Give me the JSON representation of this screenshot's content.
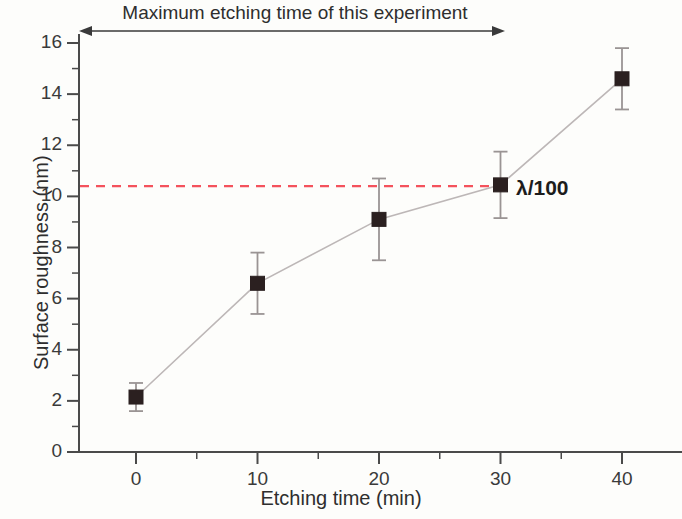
{
  "chart_data": {
    "type": "scatter",
    "title": "",
    "xlabel": "Etching time (min)",
    "ylabel": "Surface roughness (nm)",
    "xlim": [
      -5,
      46
    ],
    "ylim": [
      0,
      17
    ],
    "x_ticks": [
      0,
      10,
      20,
      30,
      40
    ],
    "x_minor_ticks": [
      5,
      15,
      25,
      35
    ],
    "y_ticks": [
      0,
      2,
      4,
      6,
      8,
      10,
      12,
      14,
      16
    ],
    "y_minor_ticks": [
      1,
      3,
      5,
      7,
      9,
      11,
      13,
      15
    ],
    "grid": false,
    "legend_position": "none",
    "series": [
      {
        "name": "Surface roughness",
        "marker": "filled-square",
        "marker_color": "#2b2020",
        "line_color": "#bdb7b7",
        "x": [
          0,
          10,
          20,
          30,
          40
        ],
        "values": [
          2.15,
          6.6,
          9.1,
          10.45,
          14.6
        ],
        "yerr": [
          0.55,
          1.2,
          1.6,
          1.3,
          1.2
        ]
      }
    ],
    "reference_lines": [
      {
        "name": "lambda-over-100",
        "orientation": "horizontal",
        "value": 10.4,
        "color": "#f4525c",
        "style": "dashed",
        "label": "λ/100"
      }
    ],
    "annotations": [
      {
        "name": "max-etching-time-span",
        "text": "Maximum etching time of this experiment",
        "arrow": "double-headed",
        "x_start": 0,
        "x_end": 30
      }
    ]
  },
  "axis": {
    "x_tick_labels": [
      "0",
      "10",
      "20",
      "30",
      "40"
    ],
    "y_tick_labels": [
      "0",
      "2",
      "4",
      "6",
      "8",
      "10",
      "12",
      "14",
      "16"
    ],
    "x_title": "Etching time (min)",
    "y_title": "Surface roughness (nm)"
  },
  "labels": {
    "span_note": "Maximum etching time of this experiment",
    "lambda": "λ/100"
  },
  "colors": {
    "background": "#fdfdfb",
    "axis": "#4a4a4a",
    "marker": "#2b2020",
    "connector": "#bdb7b7",
    "reference": "#f4525c",
    "text": "#2e2e2e"
  }
}
